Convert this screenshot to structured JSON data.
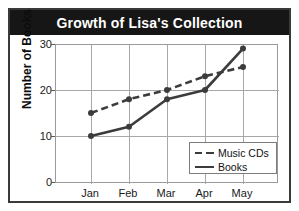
{
  "title": "Growth of Lisa's Collection",
  "axes": {
    "y_label": "Number of Books",
    "y_ticks": [
      "0",
      "10",
      "20",
      "30"
    ],
    "x_ticks": [
      "Jan",
      "Feb",
      "Mar",
      "Apr",
      "May"
    ]
  },
  "legend": {
    "items": [
      {
        "label": "Music CDs",
        "style": "dashed"
      },
      {
        "label": "Books",
        "style": "solid"
      }
    ]
  },
  "colors": {
    "title_banner": "#161616",
    "title_text": "#ffffff",
    "line": "#3c3c3c",
    "grid": "#a8a8a8",
    "frame": "#3a3a3a",
    "plot_border": "#9a9a9a",
    "background": "#ffffff"
  },
  "chart_data": {
    "type": "line",
    "title": "Growth of Lisa's Collection",
    "xlabel": "",
    "ylabel": "Number of Books",
    "categories": [
      "Jan",
      "Feb",
      "Mar",
      "Apr",
      "May"
    ],
    "series": [
      {
        "name": "Music CDs",
        "values": [
          15,
          18,
          20,
          23,
          25
        ],
        "style": "dashed"
      },
      {
        "name": "Books",
        "values": [
          10,
          12,
          18,
          20,
          29
        ],
        "style": "solid"
      }
    ],
    "ylim": [
      0,
      30
    ],
    "ytick_values": [
      0,
      10,
      20,
      30
    ],
    "grid": true,
    "legend_position": "bottom-right"
  }
}
